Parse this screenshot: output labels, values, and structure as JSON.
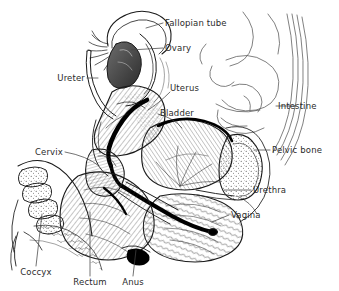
{
  "figure": {
    "background_color": "#ffffff",
    "ink_color": "#1a1a1a",
    "label_color": "#2b2b2b"
  },
  "labels": [
    {
      "id": "fallopian-tube",
      "text": "Fallopian tube",
      "x": 165,
      "y": 23,
      "align": "l"
    },
    {
      "id": "ovary",
      "text": "Ovary",
      "x": 165,
      "y": 48,
      "align": "l"
    },
    {
      "id": "ureter",
      "text": "Ureter",
      "x": 85,
      "y": 78,
      "align": "r"
    },
    {
      "id": "uterus",
      "text": "Uterus",
      "x": 170,
      "y": 88,
      "align": "l"
    },
    {
      "id": "bladder",
      "text": "Bladder",
      "x": 160,
      "y": 113,
      "align": "l"
    },
    {
      "id": "intestine",
      "text": "Intestine",
      "x": 278,
      "y": 106,
      "align": "l"
    },
    {
      "id": "pelvic-bone",
      "text": "Pelvic bone",
      "x": 272,
      "y": 150,
      "align": "l"
    },
    {
      "id": "cervix",
      "text": "Cervix",
      "x": 63,
      "y": 152,
      "align": "r"
    },
    {
      "id": "urethra",
      "text": "Urethra",
      "x": 253,
      "y": 190,
      "align": "l"
    },
    {
      "id": "vagina",
      "text": "Vagina",
      "x": 231,
      "y": 215,
      "align": "l"
    },
    {
      "id": "coccyx",
      "text": "Coccyx",
      "x": 36,
      "y": 272,
      "align": "c"
    },
    {
      "id": "rectum",
      "text": "Rectum",
      "x": 90,
      "y": 282,
      "align": "c"
    },
    {
      "id": "anus",
      "text": "Anus",
      "x": 133,
      "y": 282,
      "align": "c"
    }
  ],
  "structures": [
    "fallopian tube",
    "ovary",
    "ureter",
    "uterus",
    "bladder",
    "intestine",
    "pelvic bone",
    "cervix",
    "urethra",
    "vagina",
    "coccyx",
    "rectum",
    "anus"
  ]
}
